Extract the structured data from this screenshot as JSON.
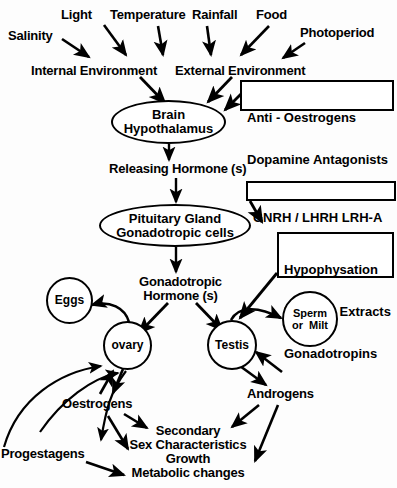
{
  "diagram": {
    "stroke_color": "#000000",
    "background_color": "#fdfdfd",
    "inputs": [
      {
        "id": "salinity",
        "label": "Salinity"
      },
      {
        "id": "light",
        "label": "Light"
      },
      {
        "id": "temperature",
        "label": "Temperature"
      },
      {
        "id": "rainfall",
        "label": "Rainfall"
      },
      {
        "id": "food",
        "label": "Food"
      },
      {
        "id": "photoperiod",
        "label": "Photoperiod"
      }
    ],
    "environments": [
      {
        "id": "internal-environment",
        "label": "Internal Environment"
      },
      {
        "id": "external-environment",
        "label": "External Environment"
      }
    ],
    "ellipses": [
      {
        "id": "brain-hypothalamus",
        "line1": "Brain",
        "line2": "Hypothalamus"
      },
      {
        "id": "pituitary-gland",
        "line1": "Pituitary Gland",
        "line2": "Gonadotropic cells"
      }
    ],
    "circles": [
      {
        "id": "eggs",
        "line1": "Eggs",
        "line2": ""
      },
      {
        "id": "ovary",
        "line1": "ovary",
        "line2": ""
      },
      {
        "id": "testis",
        "line1": "Testis",
        "line2": ""
      },
      {
        "id": "sperm-or-milt",
        "line1": "Sperm",
        "line2": "or  Milt"
      }
    ],
    "treatment_boxes": [
      {
        "id": "anti-oestrogens-box",
        "line1": "Anti - Oestrogens",
        "line2": "Dopamine Antagonists",
        "line3": ""
      },
      {
        "id": "gnrh-box",
        "line1": "GNRH / LHRH LRH-A",
        "line2": "",
        "line3": ""
      },
      {
        "id": "hypophysation-box",
        "line1": "Hypophysation",
        "line2": "Pituitary Extracts",
        "line3": "Gonadotropins"
      }
    ],
    "intermediates": [
      {
        "id": "releasing-hormones",
        "label": "Releasing Hormone (s)"
      },
      {
        "id": "gonadotropic-hormones-line1",
        "label": "Gonadotropic"
      },
      {
        "id": "gonadotropic-hormones-line2",
        "label": "Hormone (s)"
      }
    ],
    "outputs": [
      {
        "id": "oestrogens",
        "label": "Oestrogens"
      },
      {
        "id": "androgens",
        "label": "Androgens"
      },
      {
        "id": "progestagens",
        "label": "Progestagens"
      }
    ],
    "effects": {
      "id": "effects-block",
      "line1": "Secondary",
      "line2": "Sex Characteristics",
      "line3": "Growth",
      "line4": "Metabolic changes"
    }
  }
}
